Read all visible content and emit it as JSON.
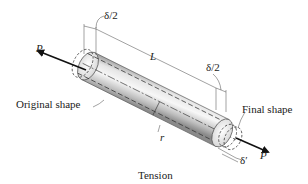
{
  "figure": {
    "caption": "Tension",
    "labels": {
      "load_left": "P",
      "load_right": "P",
      "length": "L",
      "elongation_half_left": "δ/2",
      "elongation_half_right": "δ/2",
      "lateral_contraction": "δ′",
      "radius": "r",
      "original_shape": "Original shape",
      "final_shape": "Final shape"
    },
    "colors": {
      "line": "#222222",
      "cylinder_light": "#f2f2f2",
      "cylinder_mid": "#c8c8c8",
      "cylinder_dark": "#8c8c8c",
      "arrow": "#111111"
    }
  }
}
